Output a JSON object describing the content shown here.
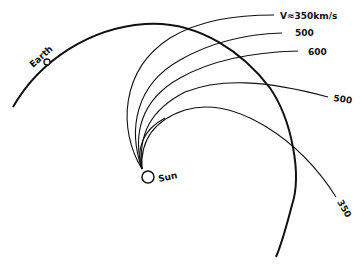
{
  "diagram": {
    "labels": {
      "earth": "Earth",
      "sun": "Sun",
      "v350_top": "V≈350km/s",
      "v500_a": "500",
      "v600": "600",
      "v500_b": "500",
      "v350_bottom": "350"
    },
    "streamlines": [
      {
        "label": "V≈350km/s",
        "speed_km_s": 350
      },
      {
        "label": "500",
        "speed_km_s": 500
      },
      {
        "label": "600",
        "speed_km_s": 600
      },
      {
        "label": "500",
        "speed_km_s": 500
      },
      {
        "label": "350",
        "speed_km_s": 350
      }
    ],
    "colors": {
      "line": "#111111",
      "background": "#ffffff"
    }
  }
}
